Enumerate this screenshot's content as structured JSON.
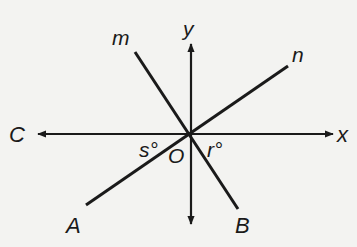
{
  "diagram": {
    "type": "geometry-intersecting-lines",
    "origin": {
      "label": "O",
      "x": 190,
      "y": 134
    },
    "axes": {
      "x_axis": {
        "label_right": "x",
        "label_left": "C",
        "arrows": "both"
      },
      "y_axis": {
        "label_top": "y",
        "arrows": "both"
      }
    },
    "lines": [
      {
        "name": "m",
        "end_label": "B",
        "from": [
          135,
          52
        ],
        "to": [
          238,
          209
        ]
      },
      {
        "name": "n",
        "end_label": "A",
        "from": [
          288,
          66
        ],
        "to": [
          86,
          205
        ]
      }
    ],
    "angles": [
      {
        "label": "s°",
        "between": "OC and OA"
      },
      {
        "label": "r°",
        "between": "OB and Ox"
      }
    ],
    "labels": {
      "y": "y",
      "x": "x",
      "C": "C",
      "m": "m",
      "n": "n",
      "A": "A",
      "B": "B",
      "O": "O",
      "s": "s°",
      "r": "r°"
    },
    "colors": {
      "line": "#1a1a1a",
      "background": "#f3f3f1"
    }
  }
}
